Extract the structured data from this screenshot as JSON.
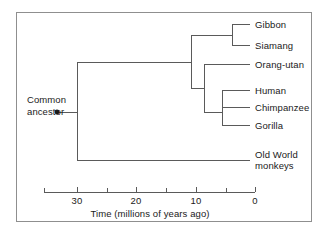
{
  "figure": {
    "type": "phylogenetic-tree",
    "root_label_line1": "Common",
    "root_label_line2": "ancestor",
    "tips": [
      {
        "id": "gibbon",
        "label": "Gibbon"
      },
      {
        "id": "siamang",
        "label": "Siamang"
      },
      {
        "id": "orang-utan",
        "label": "Orang-utan"
      },
      {
        "id": "human",
        "label": "Human"
      },
      {
        "id": "chimpanzee",
        "label": "Chimpanzee"
      },
      {
        "id": "gorilla",
        "label": "Gorilla"
      },
      {
        "id": "old-world-monkeys",
        "label_line1": "Old World",
        "label_line2": "monkeys"
      }
    ],
    "axis": {
      "title": "Time (millions of years ago)",
      "ticks": [
        "30",
        "20",
        "10",
        "0"
      ],
      "tick_values": [
        30,
        20,
        10,
        0
      ],
      "minor_tick_values": [
        35,
        25,
        15,
        5
      ],
      "range_min": 0,
      "range_max": 35,
      "direction": "right-to-left"
    },
    "divergences": {
      "root_mya": 30,
      "gibbon_siamang_mya": 4,
      "orangutan_mya": 11,
      "african_apes_mya": 8
    },
    "colors": {
      "line": "#5a5a5a",
      "frame": "#8f8f8f",
      "text": "#1a1a1a",
      "background": "#ffffff"
    }
  }
}
